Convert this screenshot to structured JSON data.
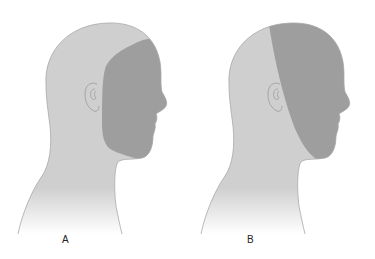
{
  "figure": {
    "panels": [
      {
        "label": "A",
        "region": "face (anterior head below hairline, ear excluded)"
      },
      {
        "label": "B",
        "region": "anterior head including scalp front to chin"
      }
    ],
    "colors": {
      "head_fill": "#cfcfcf",
      "head_outline": "#a8a8a8",
      "shaded_region": "#9e9e9e",
      "ear_outline": "#9a9a9a",
      "background": "#ffffff"
    }
  }
}
